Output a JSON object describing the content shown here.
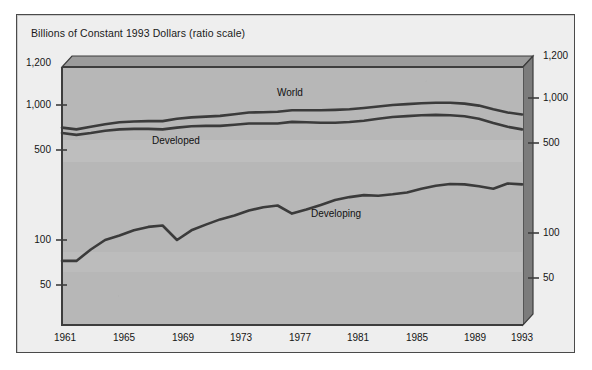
{
  "figure": {
    "title": "Billions of Constant 1993 Dollars (ratio scale)",
    "background_color": "#eeeeee",
    "plot_color": "#b8b8b8",
    "line_color": "#3d3d3d",
    "frame_color": "#4a4a4a"
  },
  "axes": {
    "y_ticks": [
      "1,200",
      "1,000",
      "500",
      "100",
      "50"
    ],
    "y_tick_values": [
      1200,
      1000,
      500,
      100,
      50
    ],
    "x_ticks": [
      "1961",
      "1965",
      "1969",
      "1973",
      "1977",
      "1981",
      "1985",
      "1989",
      "1993"
    ],
    "x_tick_values": [
      1961,
      1965,
      1969,
      1973,
      1977,
      1981,
      1985,
      1989,
      1993
    ],
    "y_scale": "log",
    "x_label": "",
    "y_label": "Billions of Constant 1993 Dollars (ratio scale)"
  },
  "series_labels": {
    "world": "World",
    "developed": "Developed",
    "developing": "Developing"
  },
  "chart_data": {
    "type": "line",
    "title": "Billions of Constant 1993 Dollars (ratio scale)",
    "xlabel": "",
    "ylabel": "Billions of Constant 1993 Dollars (ratio scale)",
    "yscale": "log",
    "ylim": [
      40,
      1200
    ],
    "xlim": [
      1961,
      1993
    ],
    "grid": false,
    "legend": "inline-annotations",
    "x": [
      1961,
      1962,
      1963,
      1964,
      1965,
      1966,
      1967,
      1968,
      1969,
      1970,
      1971,
      1972,
      1973,
      1974,
      1975,
      1976,
      1977,
      1978,
      1979,
      1980,
      1981,
      1982,
      1983,
      1984,
      1985,
      1986,
      1987,
      1988,
      1989,
      1990,
      1991,
      1992,
      1993
    ],
    "series": [
      {
        "name": "World",
        "values": [
          680,
          660,
          690,
          720,
          745,
          755,
          760,
          760,
          790,
          810,
          820,
          830,
          855,
          880,
          885,
          890,
          915,
          915,
          915,
          920,
          930,
          950,
          975,
          1000,
          1015,
          1030,
          1040,
          1040,
          1025,
          990,
          930,
          880,
          850
        ]
      },
      {
        "name": "Developed",
        "values": [
          620,
          600,
          620,
          645,
          660,
          665,
          665,
          660,
          680,
          695,
          700,
          700,
          715,
          730,
          730,
          730,
          750,
          745,
          740,
          740,
          748,
          765,
          790,
          815,
          828,
          840,
          845,
          840,
          825,
          790,
          735,
          690,
          660
        ]
      },
      {
        "name": "Developing",
        "values": [
          70,
          70,
          85,
          100,
          108,
          118,
          125,
          128,
          100,
          118,
          130,
          142,
          152,
          165,
          175,
          180,
          157,
          168,
          182,
          198,
          208,
          215,
          213,
          218,
          225,
          240,
          252,
          260,
          258,
          250,
          240,
          262,
          258
        ]
      }
    ]
  }
}
